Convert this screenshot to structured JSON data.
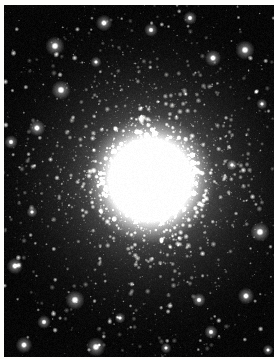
{
  "page": {
    "background_color": "#fdfdfb",
    "width": 274,
    "height": 359
  },
  "photo": {
    "name": "globular-cluster-photograph",
    "subject": "globular star cluster",
    "frame": {
      "left": 4,
      "top": 5,
      "width": 270,
      "height": 352
    },
    "background_color": "#000000",
    "core_color": "#ffffff",
    "halo_color": "#d8d8d8",
    "field_color": "#070707",
    "core": {
      "x": 150,
      "y": 180,
      "saturated_radius": 26,
      "halo_radius": 118
    },
    "star_count": 4200,
    "bright_star_count": 170,
    "caption": ""
  },
  "chart_data": {
    "type": "scatter",
    "xlabel": "",
    "ylabel": "",
    "xlim": [
      0,
      274
    ],
    "ylim": [
      0,
      359
    ],
    "grid": false,
    "legend": null,
    "center": [
      150,
      180
    ],
    "profile": {
      "description": "radial surface brightness falls off from saturated core to sparse background field",
      "radii": [
        0,
        15,
        30,
        50,
        75,
        100,
        130,
        170
      ],
      "brightness": [
        255,
        255,
        215,
        150,
        92,
        48,
        20,
        6
      ]
    },
    "bright_stars": [
      [
        268,
        350
      ],
      [
        211,
        332
      ],
      [
        24,
        345
      ],
      [
        96,
        347
      ],
      [
        166,
        348
      ],
      [
        44,
        322
      ],
      [
        15,
        266
      ],
      [
        75,
        300
      ],
      [
        120,
        318
      ],
      [
        199,
        300
      ],
      [
        246,
        296
      ],
      [
        260,
        232
      ],
      [
        32,
        212
      ],
      [
        11,
        142
      ],
      [
        37,
        128
      ],
      [
        61,
        90
      ],
      [
        96,
        62
      ],
      [
        151,
        30
      ],
      [
        213,
        58
      ],
      [
        245,
        50
      ],
      [
        262,
        104
      ],
      [
        190,
        18
      ],
      [
        104,
        23
      ],
      [
        55,
        46
      ],
      [
        232,
        165
      ]
    ]
  }
}
